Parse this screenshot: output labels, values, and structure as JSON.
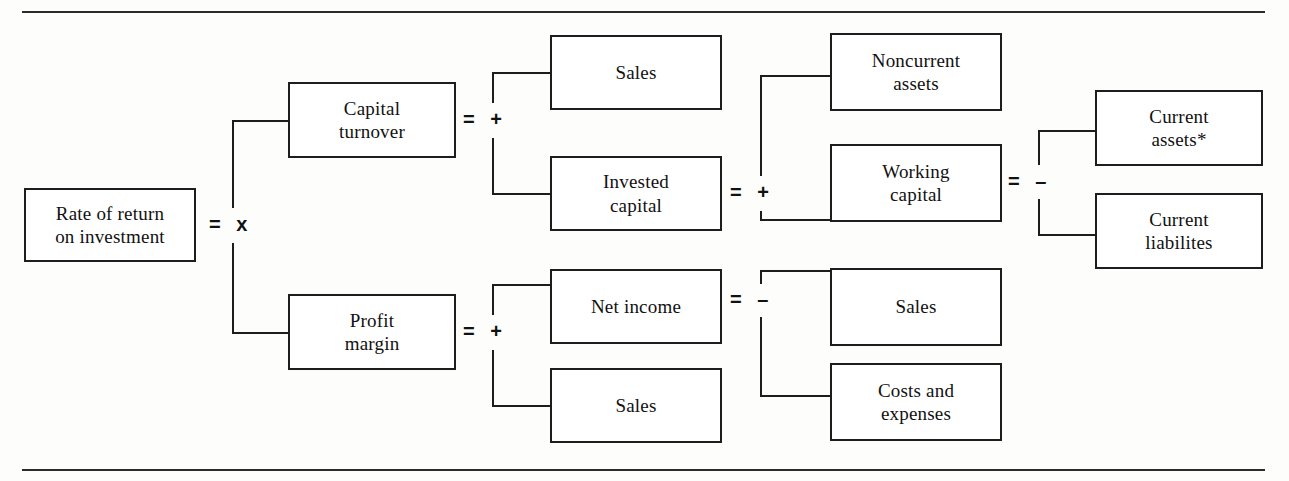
{
  "figure": {
    "type": "tree-diagram",
    "orientation": "left-to-right",
    "line_color": "#1d1d1d",
    "text_color": "#111111",
    "background": "#ffffff"
  },
  "nodes": {
    "root": {
      "label": "Rate of return\non investment",
      "line1": "Rate of return",
      "line2": "on investment"
    },
    "capital_turnover": {
      "line1": "Capital",
      "line2": "turnover"
    },
    "profit_margin": {
      "line1": "Profit",
      "line2": "margin"
    },
    "sales_top": {
      "line1": "Sales",
      "line2": ""
    },
    "invested_capital": {
      "line1": "Invested",
      "line2": "capital"
    },
    "net_income": {
      "line1": "Net income",
      "line2": ""
    },
    "sales_bottom": {
      "line1": "Sales",
      "line2": ""
    },
    "noncurrent_assets": {
      "line1": "Noncurrent",
      "line2": "assets"
    },
    "working_capital": {
      "line1": "Working",
      "line2": "capital"
    },
    "sales_mid": {
      "line1": "Sales",
      "line2": ""
    },
    "costs_and_expenses": {
      "line1": "Costs and",
      "line2": "expenses"
    },
    "current_assets": {
      "line1": "Current",
      "line2": "assets*"
    },
    "current_liabilities": {
      "line1": "Current",
      "line2": "liabilites"
    }
  },
  "operators": {
    "root_split": "=  x",
    "capital_turnover_split": "=  +",
    "profit_margin_split": "=  +",
    "invested_capital_split": "=  +",
    "net_income_split": "=  –",
    "working_capital_split": "=  –"
  },
  "relations": [
    {
      "parent": "root",
      "operator": "=  x",
      "children": [
        "capital_turnover",
        "profit_margin"
      ]
    },
    {
      "parent": "capital_turnover",
      "operator": "=  +",
      "children": [
        "sales_top",
        "invested_capital"
      ]
    },
    {
      "parent": "profit_margin",
      "operator": "=  +",
      "children": [
        "net_income",
        "sales_bottom"
      ]
    },
    {
      "parent": "invested_capital",
      "operator": "=  +",
      "children": [
        "noncurrent_assets",
        "working_capital"
      ]
    },
    {
      "parent": "net_income",
      "operator": "=  –",
      "children": [
        "sales_mid",
        "costs_and_expenses"
      ]
    },
    {
      "parent": "working_capital",
      "operator": "=  –",
      "children": [
        "current_assets",
        "current_liabilities"
      ]
    }
  ]
}
